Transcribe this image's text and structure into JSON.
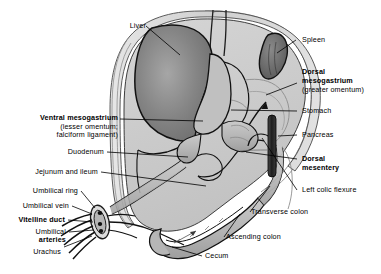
{
  "figure": {
    "type": "anatomical-diagram",
    "background": "#ffffff",
    "line_color": "#000000",
    "palette": {
      "body_wall": "#d8d8d8",
      "peritoneal_fill": "#c9c9c9",
      "gut_fill": "#b8b8b8",
      "liver": "#7e7e7e",
      "spleen": "#6a6a6a",
      "pancreas": "#2a2a2a",
      "vessel_dark": "#1a1a1a"
    }
  },
  "labels": {
    "liver": "Liver",
    "ventral_mesogastrium": "Ventral mesogastrium",
    "ventral_mesogastrium_sub1": "(lesser omentum;",
    "ventral_mesogastrium_sub2": "falciform ligament)",
    "duodenum": "Duodenum",
    "jejunum_ileum": "Jejunum and ileum",
    "umbilical_ring": "Umbilical ring",
    "umbilical_vein": "Umbilical vein",
    "vitelline_duct": "Vitelline duct",
    "umbilical": "Umbilical",
    "arteries": "arteries",
    "urachus": "Urachus",
    "spleen": "Spleen",
    "dorsal_mesogastrium_1": "Dorsal",
    "dorsal_mesogastrium_2": "mesogastrium",
    "dorsal_mesogastrium_sub": "(greater omentum)",
    "stomach": "Stomach",
    "pancreas": "Pancreas",
    "dorsal_mesentery_1": "Dorsal",
    "dorsal_mesentery_2": "mesentery",
    "left_colic_flexure": "Left colic flexure",
    "transverse_colon": "Transverse colon",
    "ascending_colon": "Ascending colon",
    "cecum": "Cecum"
  }
}
